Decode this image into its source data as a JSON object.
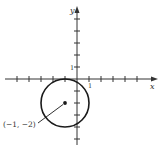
{
  "figure": {
    "x_axis_label": "x",
    "y_axis_label": "y",
    "x_tick_label": "1",
    "y_tick_label": "1",
    "center_label": "(−1, −2)",
    "colors": {
      "ink": "#1a1a1a",
      "axis": "#333333",
      "background": "#ffffff"
    }
  },
  "geometry": {
    "unit_px": 12,
    "origin_px": [
      77,
      79
    ],
    "x_range": [
      -6,
      6
    ],
    "y_range": [
      -5,
      6
    ],
    "circle": {
      "center": [
        -1,
        -2
      ],
      "radius": 2
    }
  }
}
